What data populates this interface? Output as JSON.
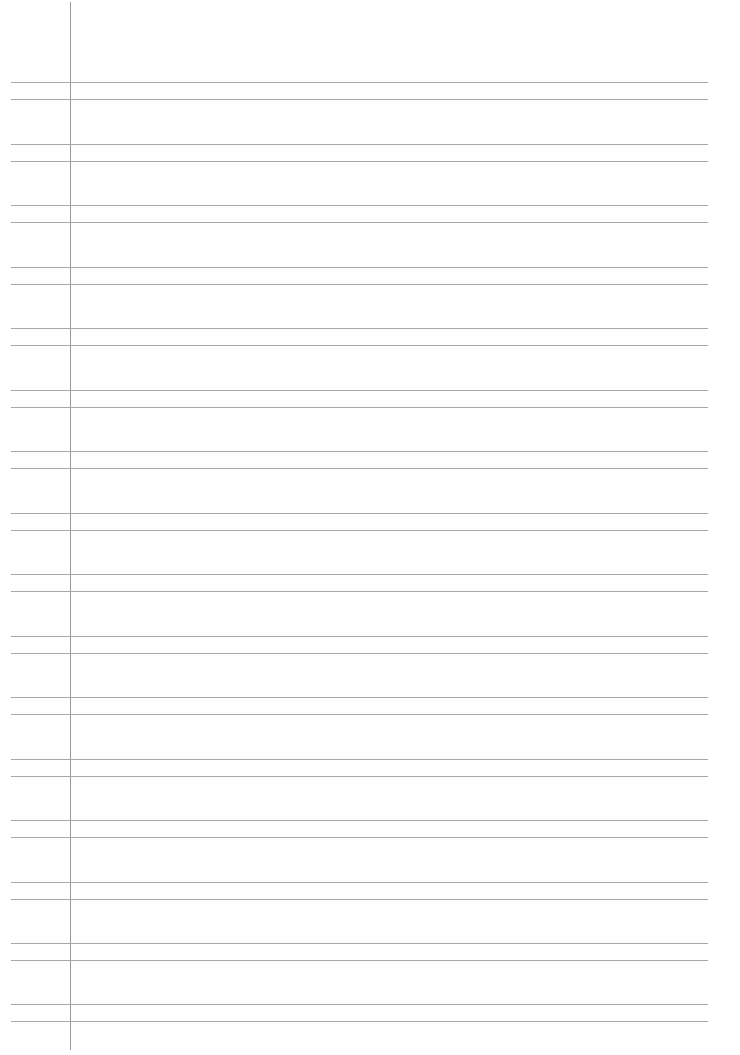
{
  "page": {
    "type": "lined-paper",
    "background_color": "#ffffff",
    "line_color": "#a8a8a8",
    "margin_line_color": "#9a9a9a",
    "margin_x": 70,
    "line_left": 11,
    "line_right": 708,
    "pair_gap": 17,
    "line_pairs_top": [
      82,
      144,
      205,
      267,
      328,
      390,
      451,
      513,
      574,
      636,
      697,
      759,
      820,
      882,
      943,
      1004
    ]
  }
}
